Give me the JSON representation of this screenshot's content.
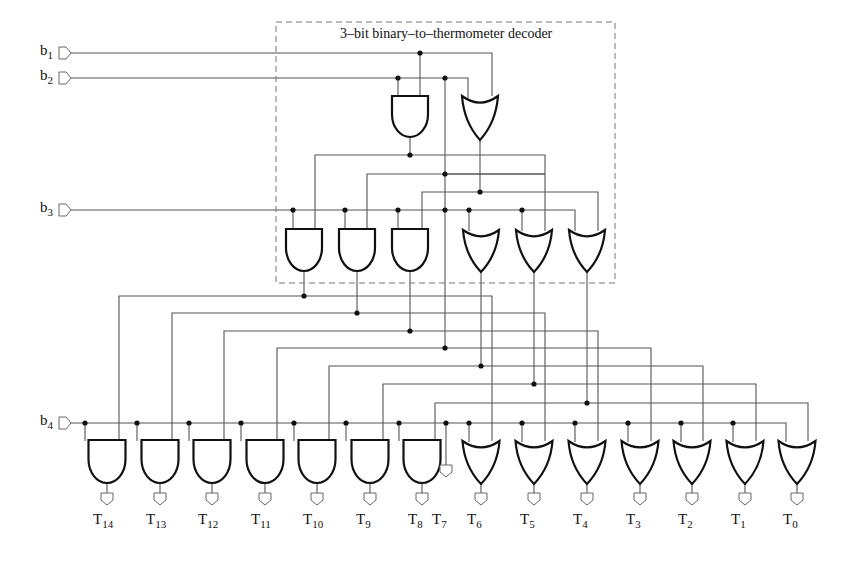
{
  "diagram": {
    "title_text": "3–bit binary–to–thermometer decoder",
    "inputs": [
      {
        "name": "b",
        "sub": "1",
        "y": 53
      },
      {
        "name": "b",
        "sub": "2",
        "y": 78
      },
      {
        "name": "b",
        "sub": "3",
        "y": 210
      },
      {
        "name": "b",
        "sub": "4",
        "y": 423
      }
    ],
    "outputs": [
      {
        "name": "T",
        "sub": "14"
      },
      {
        "name": "T",
        "sub": "13"
      },
      {
        "name": "T",
        "sub": "12"
      },
      {
        "name": "T",
        "sub": "11"
      },
      {
        "name": "T",
        "sub": "10"
      },
      {
        "name": "T",
        "sub": "9"
      },
      {
        "name": "T",
        "sub": "8"
      },
      {
        "name": "T",
        "sub": "7"
      },
      {
        "name": "T",
        "sub": "6"
      },
      {
        "name": "T",
        "sub": "5"
      },
      {
        "name": "T",
        "sub": "4"
      },
      {
        "name": "T",
        "sub": "3"
      },
      {
        "name": "T",
        "sub": "2"
      },
      {
        "name": "T",
        "sub": "1"
      },
      {
        "name": "T",
        "sub": "0"
      }
    ],
    "gate_types": {
      "level1": [
        "AND",
        "OR"
      ],
      "level2": [
        "AND",
        "AND",
        "AND",
        "OR",
        "OR",
        "OR"
      ],
      "level3": [
        "AND",
        "AND",
        "AND",
        "AND",
        "AND",
        "AND",
        "AND",
        "WIRE",
        "OR",
        "OR",
        "OR",
        "OR",
        "OR",
        "OR",
        "OR"
      ]
    },
    "colors": {
      "wire": "#555555",
      "gate": "#111111",
      "dashed_box": "#777777",
      "terminal": "#666666"
    }
  }
}
